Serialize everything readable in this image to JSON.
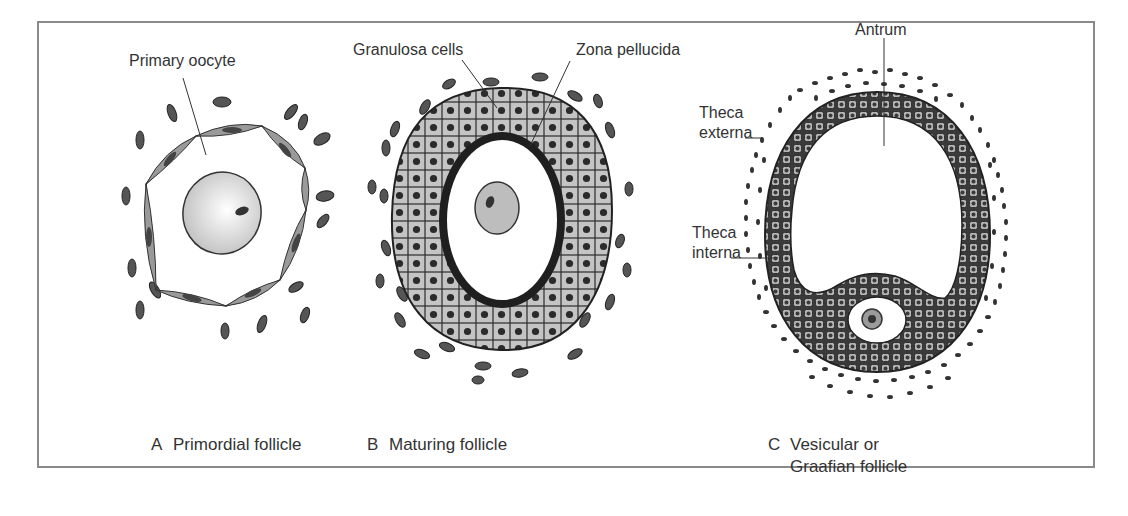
{
  "figure": {
    "panels": [
      {
        "id": "A",
        "letter": "A",
        "caption": "Primordial follicle",
        "labels": [
          "Primary oocyte"
        ]
      },
      {
        "id": "B",
        "letter": "B",
        "caption": "Maturing follicle",
        "labels": [
          "Granulosa cells",
          "Zona pellucida"
        ]
      },
      {
        "id": "C",
        "letter": "C",
        "caption_line1": "Vesicular or",
        "caption_line2": "Graafian follicle",
        "labels": [
          "Antrum",
          "Theca externa",
          "Theca interna"
        ],
        "theca_externa_line1": "Theca",
        "theca_externa_line2": "externa",
        "theca_interna_line1": "Theca",
        "theca_interna_line2": "interna"
      }
    ],
    "colors": {
      "frame": "#8a8a8a",
      "ink": "#2b2b2b",
      "cell_fill": "#bdbdbd",
      "dark_fill": "#3a3a3a",
      "oocyte_fill": "#d9d9d9"
    }
  }
}
